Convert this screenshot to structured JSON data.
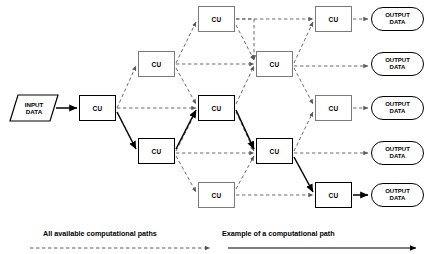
{
  "diagram": {
    "input": {
      "label": "INPUT\nDATA",
      "line1": "INPUT",
      "line2": "DATA"
    },
    "unit_label": "CU",
    "output_label_line1": "OUTPUT",
    "output_label_line2": "DATA",
    "colors": {
      "dashed_edge": "#5a5a5a",
      "solid_edge": "#000000",
      "box_border": "#7a7a7a",
      "bold_border": "#000000",
      "background": "#ffffff"
    },
    "columns": [
      {
        "name": "column-1",
        "units": [
          {
            "id": "c1r3",
            "label": "CU",
            "row": 3,
            "highlighted": true
          }
        ]
      },
      {
        "name": "column-2",
        "units": [
          {
            "id": "c2r2",
            "label": "CU",
            "row": 2,
            "highlighted": false
          },
          {
            "id": "c2r4",
            "label": "CU",
            "row": 4,
            "highlighted": true
          }
        ]
      },
      {
        "name": "column-3",
        "units": [
          {
            "id": "c3r1",
            "label": "CU",
            "row": 1,
            "highlighted": false
          },
          {
            "id": "c3r3",
            "label": "CU",
            "row": 3,
            "highlighted": true
          },
          {
            "id": "c3r5",
            "label": "CU",
            "row": 5,
            "highlighted": false
          }
        ]
      },
      {
        "name": "column-4",
        "units": [
          {
            "id": "c4r2",
            "label": "CU",
            "row": 2,
            "highlighted": false
          },
          {
            "id": "c4r4",
            "label": "CU",
            "row": 4,
            "highlighted": true
          }
        ]
      },
      {
        "name": "column-5",
        "units": [
          {
            "id": "c5r1",
            "label": "CU",
            "row": 1,
            "highlighted": false
          },
          {
            "id": "c5r3",
            "label": "CU",
            "row": 3,
            "highlighted": false
          },
          {
            "id": "c5r5",
            "label": "CU",
            "row": 5,
            "highlighted": true
          }
        ]
      }
    ],
    "outputs": [
      {
        "id": "out1",
        "line1": "OUTPUT",
        "line2": "DATA",
        "row": 1
      },
      {
        "id": "out2",
        "line1": "OUTPUT",
        "line2": "DATA",
        "row": 2
      },
      {
        "id": "out3",
        "line1": "OUTPUT",
        "line2": "DATA",
        "row": 3
      },
      {
        "id": "out4",
        "line1": "OUTPUT",
        "line2": "DATA",
        "row": 4
      },
      {
        "id": "out5",
        "line1": "OUTPUT",
        "line2": "DATA",
        "row": 5
      }
    ],
    "highlighted_path": [
      "INPUT DATA",
      "c1r3",
      "c2r4",
      "c3r3",
      "c4r4",
      "c5r5",
      "out5"
    ]
  },
  "legend": {
    "left": {
      "text": "All available computational paths",
      "style": "dashed-arrow"
    },
    "right": {
      "text": "Example of a computational path",
      "style": "solid-arrow"
    }
  }
}
